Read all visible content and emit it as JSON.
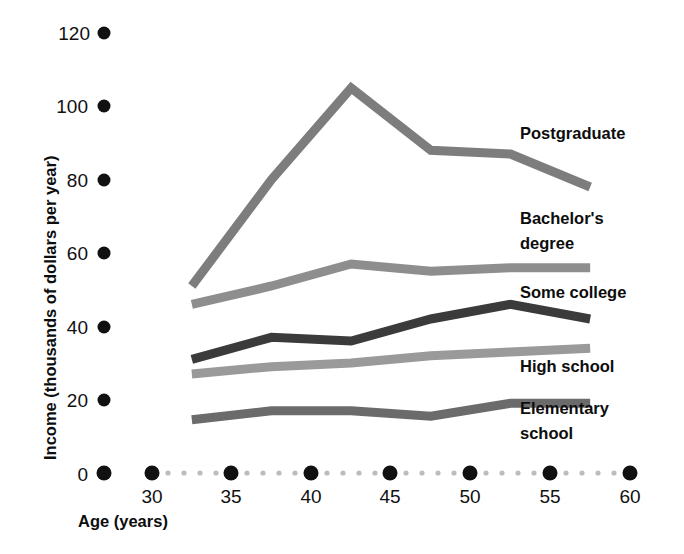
{
  "chart_data": {
    "type": "line",
    "title": "",
    "xlabel": "Age (years)",
    "ylabel": "Income (thousands of dollars per year)",
    "xlim": [
      27.5,
      62
    ],
    "ylim": [
      0,
      125
    ],
    "xticks": [
      30,
      35,
      40,
      45,
      50,
      55,
      60
    ],
    "yticks": [
      0,
      20,
      40,
      60,
      80,
      100,
      120
    ],
    "grid": false,
    "legend_position": "right-inline",
    "x": [
      32.5,
      37.5,
      42.5,
      47.5,
      52.5,
      57.5
    ],
    "series": [
      {
        "name": "Postgraduate",
        "color": "#7d7d7d",
        "values": [
          51,
          80,
          105,
          88,
          87,
          78
        ],
        "label_x": 60,
        "label_y": 103
      },
      {
        "name": "Bachelor's degree",
        "color": "#8e8e8e",
        "values": [
          46,
          51,
          57,
          55,
          56,
          56
        ],
        "label_x": 60,
        "label_y": 66
      },
      {
        "name": "Some college",
        "color": "#3b3b3b",
        "values": [
          31,
          37,
          36,
          42,
          46,
          42
        ],
        "label_x": 60,
        "label_y": 47
      },
      {
        "name": "High school",
        "color": "#9a9a9a",
        "values": [
          27,
          29,
          30,
          32,
          33,
          34
        ],
        "label_x": 60,
        "label_y": 26
      },
      {
        "name": "Elementary school",
        "color": "#6b6b6b",
        "values": [
          14.5,
          17,
          17,
          15.5,
          19,
          19
        ],
        "label_x": 60,
        "label_y": 11
      }
    ]
  },
  "axes": {
    "y_axis_title": "Income (thousands of dollars per year)",
    "x_axis_title": "Age (years)",
    "y_tick_labels": [
      "120",
      "100",
      "80",
      "60",
      "40",
      "20",
      "0"
    ],
    "x_tick_labels": [
      "30",
      "35",
      "40",
      "45",
      "50",
      "55",
      "60"
    ]
  },
  "legend_labels": {
    "postgraduate": "Postgraduate",
    "bachelors_line1": "Bachelor's",
    "bachelors_line2": "degree",
    "some_college": "Some college",
    "high_school": "High school",
    "elementary_line1": "Elementary",
    "elementary_line2": "school"
  },
  "colors": {
    "postgraduate": "#7d7d7d",
    "bachelors": "#8e8e8e",
    "some_college": "#3b3b3b",
    "high_school": "#9a9a9a",
    "elementary": "#6b6b6b",
    "tick_dot": "#111111",
    "minor_dot": "#bdbdbd",
    "text": "#0d0d0d",
    "background": "#ffffff"
  }
}
